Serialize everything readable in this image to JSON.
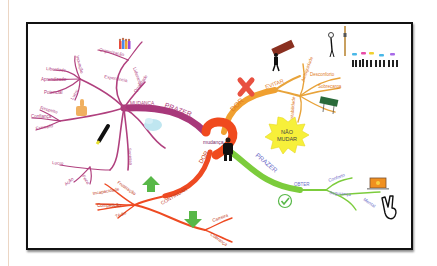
{
  "mindmap": {
    "center": {
      "label": "mudança"
    },
    "burst": {
      "line1": "NÃO",
      "line2": "MUDAR"
    },
    "colors": {
      "mudanca": "#b0407e",
      "evitar": "#e8a33a",
      "obter": "#7ccc3c",
      "continuar": "#ee4a22",
      "center": "#f04a1e",
      "burst": "#f7f03a",
      "obter_text": "#6e6ec8"
    },
    "branches": {
      "prazer_mudanca": {
        "label": "PRAZER",
        "node": "MUDANÇA",
        "sub": {
          "liberdade_group": {
            "hub": "Crescimento",
            "items": [
              "Liberdade",
              "Aprendizado",
              "Potencial",
              "Lucro"
            ],
            "top": "Inovação"
          },
          "experiencia": "Experiência",
          "organizacao": "Organização",
          "lideranca": "Liderança",
          "qualidade": "Qualidade",
          "confianca_group": {
            "items": [
              "Respeito",
              "Confiança",
              "Exemplo"
            ]
          },
          "lucro_group": {
            "items": [
              "Lucro",
              "Ação",
              "Foco"
            ]
          },
          "sucesso": "Sucesso"
        }
      },
      "dor_evitar": {
        "label": "DOR",
        "node": "EVITAR",
        "items": [
          "Ambiguidade",
          "Desconforto",
          "Sobrecarga",
          "Instabilidade"
        ]
      },
      "prazer_obter": {
        "label": "PRAZER",
        "node": "OBTER",
        "items": [
          "Conforto",
          "Segurança",
          "Mental"
        ]
      },
      "dor_continuar": {
        "label": "DOR",
        "node": "CONTINUAR",
        "items": [
          "Frustração",
          "Incapacidade",
          "Competição",
          "Tédio",
          "Carreira",
          "Cobrança"
        ]
      }
    },
    "icons": [
      "people-group-icon",
      "thumbs-up-icon",
      "highlighter-icon",
      "cloud-icon",
      "x-mark-icon",
      "man-carrying-box-icon",
      "thinking-person-icon",
      "crowd-speech-icon",
      "road-sign-icon",
      "up-arrow-icon",
      "down-arrow-icon",
      "checkmark-icon",
      "laptop-money-icon",
      "victory-hand-icon",
      "businessman-icon"
    ]
  }
}
